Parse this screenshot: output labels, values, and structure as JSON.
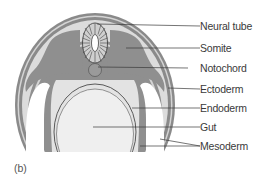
{
  "figure": {
    "panel_label": "(b)",
    "labels": [
      {
        "id": "neural-tube",
        "text": "Neural tube",
        "y": 26
      },
      {
        "id": "somite",
        "text": "Somite",
        "y": 48
      },
      {
        "id": "notochord",
        "text": "Notochord",
        "y": 68
      },
      {
        "id": "ectoderm",
        "text": "Ectoderm",
        "y": 89
      },
      {
        "id": "endoderm",
        "text": "Endoderm",
        "y": 108
      },
      {
        "id": "gut",
        "text": "Gut",
        "y": 127
      },
      {
        "id": "mesoderm",
        "text": "Mesoderm",
        "y": 146
      }
    ],
    "colors": {
      "ectoderm": "#8a8a8a",
      "mesoderm": "#8f8f8f",
      "light_fill": "#d9d9d9",
      "gut": "#efefef",
      "cavity": "#ffffff",
      "line": "#3a3a3a"
    }
  }
}
